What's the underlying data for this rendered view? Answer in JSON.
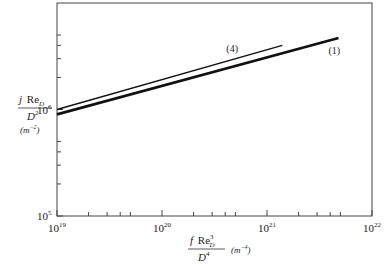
{
  "chart_data": {
    "type": "line",
    "title": "",
    "xscale": "log",
    "yscale": "log",
    "xlim": [
      1e+19,
      1e+22
    ],
    "ylim": [
      100000.0,
      10000000.0
    ],
    "xlabel": "f Re_D^3 / D^4 (m^-4)",
    "ylabel": "j Re_D / D^2 (m^-2)",
    "x_ticks": [
      {
        "value": 1e+19,
        "base": "10",
        "exp": "19"
      },
      {
        "value": 1e+20,
        "base": "10",
        "exp": "20"
      },
      {
        "value": 1e+21,
        "base": "10",
        "exp": "21"
      },
      {
        "value": 1e+22,
        "base": "10",
        "exp": "22"
      }
    ],
    "y_ticks": [
      {
        "value": 100000.0,
        "base": "10",
        "exp": "5"
      },
      {
        "value": 1000000.0,
        "base": "10",
        "exp": "6"
      }
    ],
    "grid": false,
    "legend": "inline labels",
    "series": [
      {
        "name": "(4)",
        "label": "(4)",
        "line_width": "thin",
        "x": [
          1e+19,
          1.4e+21
        ],
        "y": [
          1000000.0,
          4000000.0
        ]
      },
      {
        "name": "(1)",
        "label": "(1)",
        "line_width": "thick",
        "x": [
          1e+19,
          4.8e+21
        ],
        "y": [
          900000.0,
          4700000.0
        ]
      }
    ]
  },
  "axes": {
    "ylabel_num_j": "j",
    "ylabel_num_re": "Re",
    "ylabel_num_sub": "D",
    "ylabel_den": "D",
    "ylabel_den_exp": "2",
    "ylabel_units": "(m",
    "ylabel_units_exp": "−2",
    "ylabel_units_close": ")",
    "xlabel_num_f": "f",
    "xlabel_num_re": "Re",
    "xlabel_num_sub": "D",
    "xlabel_num_exp": "3",
    "xlabel_den": "D",
    "xlabel_den_exp": "4",
    "xlabel_units": "(m",
    "xlabel_units_exp": "−4",
    "xlabel_units_close": ")"
  }
}
